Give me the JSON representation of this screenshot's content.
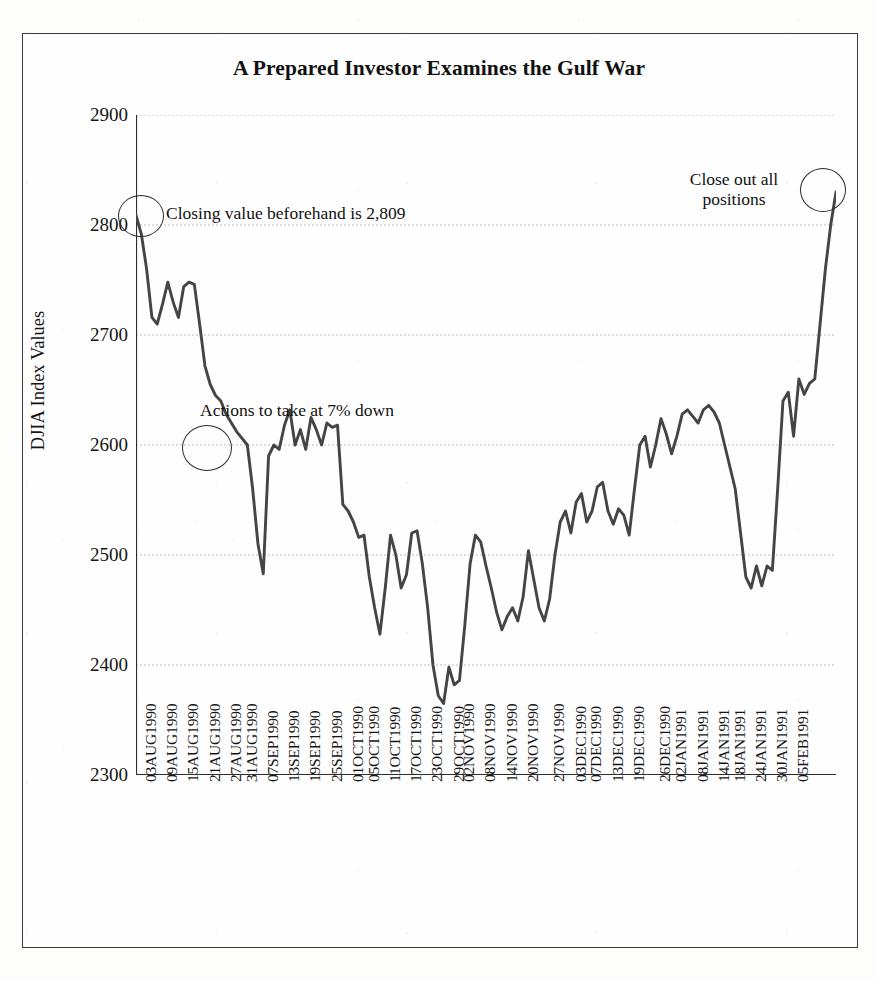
{
  "figure": {
    "title": "A Prepared Investor Examines the Gulf War",
    "frame_border_color": "#3a3a3a",
    "line_color": "#444444",
    "gridline_color": "#b9b9c4",
    "background_color": "#fefefe"
  },
  "axes": {
    "y_axis_title": "DJIA Index Values",
    "y_ticks": [
      "2300",
      "2400",
      "2500",
      "2600",
      "2700",
      "2800",
      "2900"
    ],
    "y_min": 2300,
    "y_max": 2900,
    "y_step": 100
  },
  "annotations": {
    "opening": "Closing value beforehand is 2,809",
    "seven_percent": "Actions to take at 7% down",
    "close_out": "Close out all positions"
  },
  "chart_data": {
    "type": "line",
    "title": "A Prepared Investor Examines the Gulf War",
    "xlabel": "",
    "ylabel": "DJIA Index Values",
    "ylim": [
      2300,
      2900
    ],
    "grid": true,
    "legend": "none",
    "tick_labels": [
      "03AUG1990",
      "09AUG1990",
      "15AUG1990",
      "21AUG1990",
      "27AUG1990",
      "31AUG1990",
      "07SEP1990",
      "13SEP1990",
      "19SEP1990",
      "25SEP1990",
      "01OCT1990",
      "05OCT1990",
      "11OCT1990",
      "17OCT1990",
      "23OCT1990",
      "29OCT1990",
      "02NOV1990",
      "08NOV1990",
      "14NOV1990",
      "20NOV1990",
      "27NOV1990",
      "03DEC1990",
      "07DEC1990",
      "13DEC1990",
      "19DEC1990",
      "26DEC1990",
      "02JAN1991",
      "08JAN1991",
      "14JAN1991",
      "18JAN1991",
      "24JAN1991",
      "30JAN1991",
      "05FEB1991"
    ],
    "annotation_points": [
      {
        "label": "Closing value beforehand is 2,809",
        "index": 0,
        "value": 2809
      },
      {
        "label": "Actions to take at 7% down",
        "index": 12,
        "value": 2600
      },
      {
        "label": "Close out all positions",
        "index": 128,
        "value": 2830
      }
    ],
    "series": [
      {
        "name": "DJIA Close",
        "values": [
          2809,
          2792,
          2760,
          2716,
          2710,
          2728,
          2748,
          2730,
          2716,
          2744,
          2748,
          2746,
          2710,
          2672,
          2655,
          2645,
          2640,
          2628,
          2620,
          2612,
          2606,
          2600,
          2560,
          2510,
          2483,
          2590,
          2600,
          2596,
          2618,
          2632,
          2600,
          2614,
          2596,
          2625,
          2614,
          2600,
          2620,
          2616,
          2618,
          2546,
          2540,
          2530,
          2516,
          2518,
          2480,
          2452,
          2428,
          2470,
          2518,
          2500,
          2470,
          2482,
          2520,
          2522,
          2492,
          2452,
          2400,
          2372,
          2365,
          2398,
          2382,
          2386,
          2436,
          2492,
          2518,
          2512,
          2490,
          2470,
          2448,
          2432,
          2444,
          2452,
          2440,
          2462,
          2504,
          2478,
          2452,
          2440,
          2460,
          2500,
          2530,
          2540,
          2520,
          2548,
          2556,
          2530,
          2540,
          2562,
          2566,
          2540,
          2528,
          2542,
          2536,
          2518,
          2560,
          2600,
          2608,
          2580,
          2600,
          2624,
          2610,
          2592,
          2608,
          2628,
          2632,
          2626,
          2620,
          2632,
          2636,
          2630,
          2620,
          2600,
          2580,
          2560,
          2520,
          2480,
          2470,
          2490,
          2472,
          2490,
          2486,
          2560,
          2640,
          2648,
          2608,
          2660,
          2646,
          2656,
          2660,
          2710,
          2760,
          2800,
          2830
        ]
      }
    ]
  },
  "x_tick_positions": [
    0,
    4,
    8,
    12,
    16,
    19,
    23,
    27,
    31,
    35,
    39,
    42,
    46,
    50,
    54,
    58,
    60,
    64,
    68,
    72,
    77,
    81,
    84,
    88,
    92,
    97,
    100,
    104,
    108,
    111,
    115,
    119,
    123
  ]
}
